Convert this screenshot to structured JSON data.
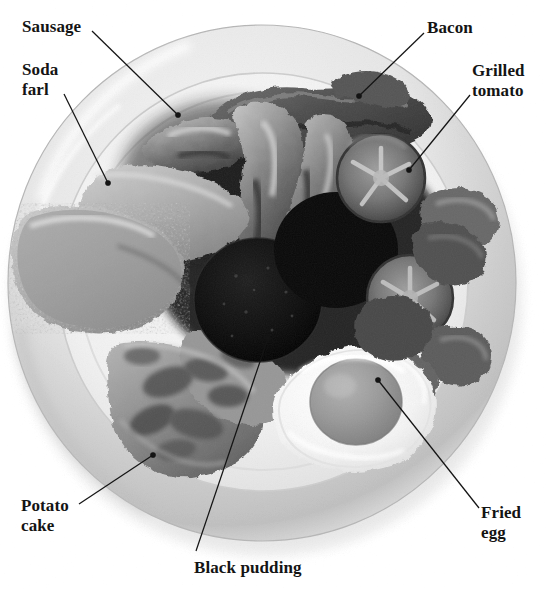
{
  "figure": {
    "kind": "labelled-photograph",
    "background_color": "#ffffff",
    "ink_color": "#141414"
  },
  "labels": [
    {
      "id": "sausage",
      "text": "Sausage",
      "x": 22,
      "y": 17,
      "align": "left"
    },
    {
      "id": "soda-farl",
      "text": "Soda\nfarl",
      "x": 22,
      "y": 60,
      "align": "left"
    },
    {
      "id": "bacon",
      "text": "Bacon",
      "x": 427,
      "y": 18,
      "align": "left"
    },
    {
      "id": "grilled-tomato",
      "text": "Grilled\ntomato",
      "x": 472,
      "y": 61,
      "align": "left"
    },
    {
      "id": "potato-cake",
      "text": "Potato\ncake",
      "x": 21,
      "y": 496,
      "align": "left"
    },
    {
      "id": "fried-egg",
      "text": "Fried\negg",
      "x": 481,
      "y": 503,
      "align": "left"
    },
    {
      "id": "black-pudding",
      "text": "Black pudding",
      "x": 194,
      "y": 558,
      "align": "left"
    }
  ],
  "leaders": [
    {
      "id": "sausage",
      "x1": 92,
      "y1": 31,
      "x2": 178,
      "y2": 115
    },
    {
      "id": "soda-farl",
      "x1": 64,
      "y1": 94,
      "x2": 108,
      "y2": 183
    },
    {
      "id": "bacon",
      "x1": 424,
      "y1": 33,
      "x2": 359,
      "y2": 96
    },
    {
      "id": "grilled-tomato",
      "x1": 470,
      "y1": 95,
      "x2": 409,
      "y2": 170
    },
    {
      "id": "potato-cake",
      "x1": 79,
      "y1": 504,
      "x2": 153,
      "y2": 455
    },
    {
      "id": "fried-egg",
      "x1": 479,
      "y1": 508,
      "x2": 378,
      "y2": 380
    },
    {
      "id": "black-pudding",
      "x1": 196,
      "y1": 551,
      "x2": 268,
      "y2": 338
    }
  ],
  "plate": {
    "center_x": 262,
    "center_y": 283,
    "radius_x": 254,
    "radius_y": 258,
    "rim_color": "#d8d8d8",
    "well_color": "#e9e9e9"
  },
  "food_items": [
    {
      "name": "sausage",
      "label": "Sausage"
    },
    {
      "name": "soda-farl",
      "label": "Soda farl"
    },
    {
      "name": "bacon",
      "label": "Bacon"
    },
    {
      "name": "grilled-tomato",
      "label": "Grilled tomato"
    },
    {
      "name": "potato-cake",
      "label": "Potato cake"
    },
    {
      "name": "fried-egg",
      "label": "Fried egg"
    },
    {
      "name": "black-pudding",
      "label": "Black pudding"
    }
  ]
}
